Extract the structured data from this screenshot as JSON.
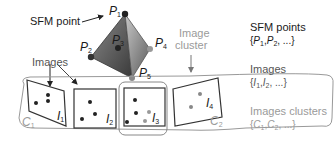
{
  "diagram": {
    "labels": {
      "sfm_point": "SFM point",
      "images": "Images",
      "image_cluster_line1": "Image",
      "image_cluster_line2": "cluster"
    },
    "points": [
      {
        "name": "P",
        "sub": "1"
      },
      {
        "name": "P",
        "sub": "2"
      },
      {
        "name": "P",
        "sub": "3"
      },
      {
        "name": "P",
        "sub": "4"
      },
      {
        "name": "P",
        "sub": "5"
      }
    ],
    "images": [
      {
        "name": "I",
        "sub": "1"
      },
      {
        "name": "I",
        "sub": "2"
      },
      {
        "name": "I",
        "sub": "3"
      },
      {
        "name": "I",
        "sub": "4"
      }
    ],
    "clusters": [
      {
        "name": "C",
        "sub": "1"
      },
      {
        "name": "C",
        "sub": "2"
      }
    ]
  },
  "legend": {
    "sfm_points": {
      "title": "SFM points",
      "set_open": "{",
      "a": "P",
      "a_sub": "1",
      "b": "P",
      "b_sub": "2",
      "set_close": ", ...}"
    },
    "images": {
      "title": "Images",
      "set_open": "{",
      "a": "I",
      "a_sub": "1",
      "b": "I",
      "b_sub": "2",
      "set_close": ", ...}"
    },
    "clusters": {
      "title": "Images clusters",
      "set_open": "{",
      "a": "C",
      "a_sub": "1",
      "b": "C",
      "b_sub": "2",
      "set_close": ", ...}"
    }
  },
  "colors": {
    "dark": "#1a1a1a",
    "mid": "#555555",
    "light": "#9a9a9a"
  }
}
